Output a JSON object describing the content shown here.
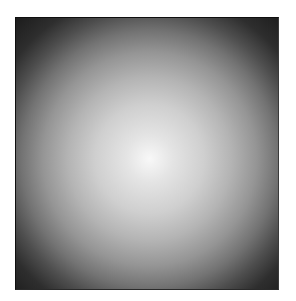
{
  "image": {
    "description": "radial gradient square, bright center fading to dark corners",
    "colors": {
      "center": "#f8f8f8",
      "mid": "#959595",
      "edge": "#1c1c1c",
      "background": "#ffffff"
    }
  }
}
